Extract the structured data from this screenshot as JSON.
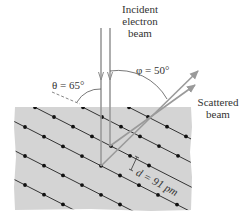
{
  "figure": {
    "labels": {
      "incident_line1": "Incident",
      "incident_line2": "electron",
      "incident_line3": "beam",
      "phi": "φ = 50°",
      "theta": "θ = 65°",
      "scattered_line1": "Scattered",
      "scattered_line2": "beam",
      "d_spacing": "d = 91 pm"
    },
    "colors": {
      "crystal": "#d4d4d4",
      "lattice_line": "#333333",
      "dot": "#111111",
      "beam": "#9a9a9a",
      "text": "#333333"
    },
    "crystal": {
      "x": 15,
      "y": 107,
      "width": 176,
      "height": 103
    },
    "lattice": {
      "step_x": 19,
      "step_y": 9.7,
      "origin": [
        102,
        117
      ],
      "row_offset": [
        -48,
        0
      ],
      "rows": [
        {
          "shift": [
            46,
            0
          ],
          "from": -1,
          "to": 2
        },
        {
          "shift": [
            0,
            0
          ],
          "from": -3,
          "to": 4
        },
        {
          "shift": [
            -48,
            0
          ],
          "from": -1,
          "to": 5
        },
        {
          "shift": [
            -77,
            10
          ],
          "from": 0,
          "to": 8
        },
        {
          "shift": [
            -77,
            39
          ],
          "from": 0,
          "to": 7
        },
        {
          "shift": [
            -77,
            68
          ],
          "from": 0,
          "to": 5
        }
      ]
    },
    "beams": {
      "incident": [
        {
          "x": 101,
          "y_top": 28,
          "y_end": 166
        },
        {
          "x": 110,
          "y_top": 28,
          "y_end": 146
        }
      ],
      "scattered": [
        {
          "from": [
            101,
            166
          ],
          "to": [
            198,
            71
          ]
        },
        {
          "from": [
            110,
            146
          ],
          "to": [
            195,
            85
          ]
        }
      ]
    }
  }
}
